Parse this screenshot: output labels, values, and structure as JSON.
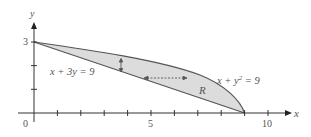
{
  "figure": {
    "axes": {
      "x_label": "x",
      "y_label": "y",
      "x_ticks": [
        "0",
        "5",
        "10"
      ],
      "y_ticks": [
        "3"
      ],
      "x_range": [
        0,
        11
      ],
      "y_range": [
        0,
        3.7
      ]
    },
    "curves": [
      {
        "name": "line",
        "equation": "x + 3y = 9"
      },
      {
        "name": "parabola",
        "equation_prefix": "x + y",
        "equation_sup": "2",
        "equation_suffix": " = 9"
      }
    ],
    "region_label": "R",
    "colors": {
      "region_fill": "#dcdcdc",
      "curve_stroke": "#555555",
      "axis_stroke": "#333333"
    }
  }
}
